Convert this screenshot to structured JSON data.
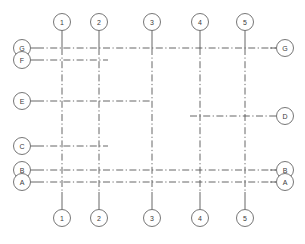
{
  "drawing": {
    "title": "Structural Column Grid Plan",
    "line_color": "#555555",
    "bubble_stroke": "#666666",
    "bubble_fill": "#ffffff",
    "text_color": "#3a3a3a",
    "background": "#ffffff",
    "line_style": "dash-dot centerline",
    "width": 305,
    "height": 244
  },
  "columns": [
    {
      "label": "1",
      "x": 62,
      "top_bubble_y": 22,
      "bottom_bubble_y": 218,
      "line_top": 31,
      "line_bottom": 209
    },
    {
      "label": "2",
      "x": 99,
      "top_bubble_y": 22,
      "bottom_bubble_y": 218,
      "line_top": 31,
      "line_bottom": 209
    },
    {
      "label": "3",
      "x": 152,
      "top_bubble_y": 22,
      "bottom_bubble_y": 218,
      "line_top": 31,
      "line_bottom": 209
    },
    {
      "label": "4",
      "x": 200,
      "top_bubble_y": 22,
      "bottom_bubble_y": 218,
      "line_top": 31,
      "line_bottom": 209
    },
    {
      "label": "5",
      "x": 245,
      "top_bubble_y": 22,
      "bottom_bubble_y": 218,
      "line_top": 31,
      "line_bottom": 209
    }
  ],
  "rows": [
    {
      "label": "G",
      "y": 48,
      "left_bubble_x": 22,
      "right_bubble_x": 285,
      "line_left": 31,
      "line_right": 276,
      "has_left_bubble": true,
      "has_right_bubble": true,
      "span": "full"
    },
    {
      "label": "F",
      "y": 60,
      "left_bubble_x": 22,
      "right_bubble_x": null,
      "line_left": 31,
      "line_right": 108,
      "has_left_bubble": true,
      "has_right_bubble": false,
      "span": "partial-left"
    },
    {
      "label": "E",
      "y": 101,
      "left_bubble_x": 22,
      "right_bubble_x": null,
      "line_left": 31,
      "line_right": 152,
      "has_left_bubble": true,
      "has_right_bubble": false,
      "span": "partial-left"
    },
    {
      "label": "D",
      "y": 116,
      "left_bubble_x": null,
      "right_bubble_x": 285,
      "line_left": 190,
      "line_right": 276,
      "has_left_bubble": false,
      "has_right_bubble": true,
      "span": "partial-right"
    },
    {
      "label": "C",
      "y": 146,
      "left_bubble_x": 22,
      "right_bubble_x": null,
      "line_left": 31,
      "line_right": 108,
      "has_left_bubble": true,
      "has_right_bubble": false,
      "span": "partial-left"
    },
    {
      "label": "B",
      "y": 170,
      "left_bubble_x": 22,
      "right_bubble_x": 285,
      "line_left": 31,
      "line_right": 276,
      "has_left_bubble": true,
      "has_right_bubble": true,
      "span": "full"
    },
    {
      "label": "A",
      "y": 182,
      "left_bubble_x": 22,
      "right_bubble_x": 285,
      "line_left": 31,
      "line_right": 276,
      "has_left_bubble": true,
      "has_right_bubble": true,
      "span": "full"
    }
  ],
  "bubble_radius": 8.5,
  "legend": {
    "column_axis_name": "Numbered column grid lines",
    "row_axis_name": "Lettered row grid lines"
  }
}
